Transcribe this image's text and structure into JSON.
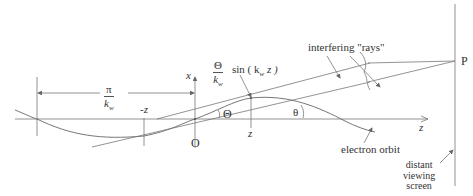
{
  "diagram": {
    "type": "undulator radiation geometry",
    "labels": {
      "pi_over_kw": {
        "numerator": "π",
        "denominator": "k",
        "denominator_sub": "w"
      },
      "minus_z": "-z",
      "x_axis": "x",
      "origin": "O",
      "amplitude": {
        "numerator": "Θ",
        "denominator": "k",
        "denominator_sub": "w",
        "suffix": "sin ( k",
        "suffix_sub": "w",
        "suffix_end": " z )"
      },
      "theta_upper": "Θ",
      "z_mark": "z",
      "theta_lower": "θ",
      "z_axis": "z",
      "interfering_rays": "interfering \"rays\"",
      "electron_orbit": "electron orbit",
      "point_p": "P",
      "screen_line1": "distant",
      "screen_line2": "viewing",
      "screen_line3": "screen"
    },
    "colors": {
      "line": "#666666",
      "text": "#333333",
      "background": "#ffffff"
    }
  }
}
